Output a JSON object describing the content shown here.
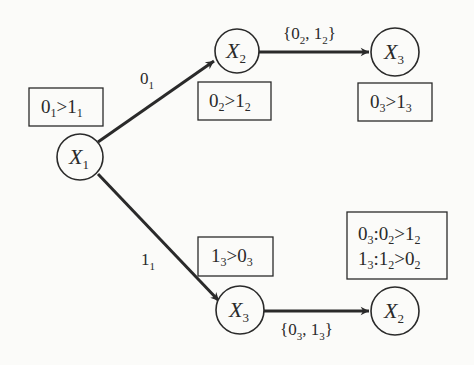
{
  "diagram": {
    "nodes": [
      {
        "id": "x1",
        "var": "X",
        "index": "1",
        "cx": 80,
        "cy": 157
      },
      {
        "id": "x2_top",
        "var": "X",
        "index": "2",
        "cx": 237,
        "cy": 51
      },
      {
        "id": "x3_top",
        "var": "X",
        "index": "3",
        "cx": 395,
        "cy": 52
      },
      {
        "id": "x3_bottom",
        "var": "X",
        "index": "3",
        "cx": 240,
        "cy": 310
      },
      {
        "id": "x2_bottom",
        "var": "X",
        "index": "2",
        "cx": 395,
        "cy": 311
      }
    ],
    "edges": [
      {
        "from": "x1",
        "to": "x2_top",
        "label_main": "0",
        "label_sub": "1"
      },
      {
        "from": "x2_top",
        "to": "x3_top",
        "label": "{0₂, 1₂}"
      },
      {
        "from": "x1",
        "to": "x3_bottom",
        "label_main": "1",
        "label_sub": "1"
      },
      {
        "from": "x3_bottom",
        "to": "x2_bottom",
        "label": "{0₃, 1₃}"
      }
    ],
    "preference_boxes": [
      {
        "id": "cpt_x1",
        "lines": [
          {
            "a": "0",
            "a_sub": "1",
            "b": "1",
            "b_sub": "1"
          }
        ]
      },
      {
        "id": "cpt_x2_top",
        "lines": [
          {
            "a": "0",
            "a_sub": "2",
            "b": "1",
            "b_sub": "2"
          }
        ]
      },
      {
        "id": "cpt_x3_top",
        "lines": [
          {
            "a": "0",
            "a_sub": "3",
            "b": "1",
            "b_sub": "3"
          }
        ]
      },
      {
        "id": "cpt_x3_bottom",
        "lines": [
          {
            "a": "1",
            "a_sub": "3",
            "b": "0",
            "b_sub": "3"
          }
        ]
      },
      {
        "id": "cpt_x2_bottom",
        "lines": [
          {
            "cond": "0",
            "cond_sub": "3",
            "a": "0",
            "a_sub": "2",
            "b": "1",
            "b_sub": "2"
          },
          {
            "cond": "1",
            "cond_sub": "3",
            "a": "1",
            "a_sub": "2",
            "b": "0",
            "b_sub": "2"
          }
        ]
      }
    ],
    "symbols": {
      "var": "X",
      "gt": ">",
      "colon": ":",
      "open_brace": "{",
      "close_brace": "}",
      "comma": ", "
    },
    "colors": {
      "line": "#2a2a2a",
      "background": "#fbfbf9"
    }
  }
}
